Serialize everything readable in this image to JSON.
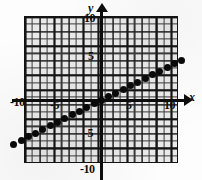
{
  "figure": {
    "kind": "coordinate-plane-graph",
    "background_color": "#fdfdfd",
    "grid_color": "#e9e9e9",
    "line_color": "#0a0a0a"
  },
  "axes": {
    "x_name": "x",
    "y_name": "y",
    "x_arrow": "right-arrow-icon",
    "y_arrow": "up-arrow-icon",
    "x_ticks": [
      "-10",
      "-5",
      "5",
      "10"
    ],
    "y_ticks": [
      "10",
      "5",
      "-5",
      "-10"
    ],
    "x_label_neg10": "-10",
    "x_label_neg5": "-5",
    "x_label_5": "5",
    "x_label_10": "10",
    "y_label_10": "10",
    "y_label_5": "5",
    "y_label_neg5": "-5",
    "y_label_neg10": "-10"
  },
  "chart_data": {
    "type": "scatter",
    "title": "",
    "subtitle": "",
    "xlabel": "x",
    "ylabel": "y",
    "xlim": [
      -11,
      10.5
    ],
    "ylim": [
      -10,
      10
    ],
    "xticks": [
      -10,
      -5,
      5,
      10
    ],
    "yticks": [
      -10,
      -5,
      5,
      10
    ],
    "grid": true,
    "grid_minor_spacing": 1,
    "grid_major_spacing": 2,
    "legend": null,
    "annotations": [],
    "series": [
      {
        "name": "y = x/2",
        "marker": "filled-circle",
        "color": "#0a0a0a",
        "x": [
          -12,
          -11,
          -10,
          -9,
          -8,
          -7,
          -6,
          -5,
          -4,
          -3,
          -2,
          -1,
          0,
          1,
          2,
          3,
          4,
          5,
          6,
          7,
          8,
          9,
          10,
          11
        ],
        "y": [
          -6,
          -5.5,
          -5,
          -4.5,
          -4,
          -3.5,
          -3,
          -2.5,
          -2,
          -1.5,
          -1,
          -0.5,
          0,
          0.5,
          1,
          1.5,
          2,
          2.5,
          3,
          3.5,
          4,
          4.5,
          5,
          5.5
        ]
      }
    ]
  }
}
